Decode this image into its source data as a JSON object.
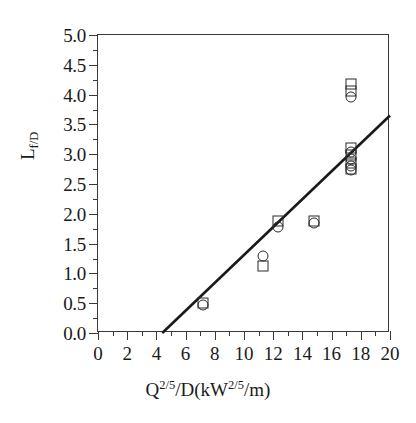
{
  "chart_data": {
    "type": "scatter",
    "title": "",
    "xlabel": "Q2/5/D(kW2/5/m)",
    "ylabel": "Lf/D",
    "xlabel_parts": {
      "base1": "Q",
      "sup1": "2/5",
      "mid": "/D(kW",
      "sup2": "2/5",
      "tail": "/m)"
    },
    "ylabel_parts": {
      "base": "L",
      "sub": "f/D"
    },
    "xlim": [
      0,
      20
    ],
    "ylim": [
      0,
      5.0
    ],
    "x_major_ticks": [
      0,
      2,
      4,
      6,
      8,
      10,
      12,
      14,
      16,
      18,
      20
    ],
    "x_minor_ticks": [
      1,
      3,
      5,
      7,
      9,
      11,
      13,
      15,
      17,
      19
    ],
    "x_tick_labels": [
      "0",
      "2",
      "4",
      "6",
      "8",
      "10",
      "12",
      "14",
      "16",
      "18",
      "20"
    ],
    "y_major_ticks": [
      0.0,
      0.5,
      1.0,
      1.5,
      2.0,
      2.5,
      3.0,
      3.5,
      4.0,
      4.5,
      5.0
    ],
    "y_minor_ticks": [
      0.25,
      0.75,
      1.25,
      1.75,
      2.25,
      2.75,
      3.25,
      3.75,
      4.25,
      4.75
    ],
    "y_tick_labels": [
      "0.0",
      "0.5",
      "1.0",
      "1.5",
      "2.0",
      "2.5",
      "3.0",
      "3.5",
      "4.0",
      "4.5",
      "5.0"
    ],
    "grid": false,
    "legend": null,
    "marker_color": "#2b2b2b",
    "line_color": "#1a1a1a",
    "series": [
      {
        "name": "square",
        "marker": "open-square",
        "points": [
          {
            "x": 7.2,
            "y": 0.5
          },
          {
            "x": 11.3,
            "y": 1.13
          },
          {
            "x": 12.3,
            "y": 1.88
          },
          {
            "x": 14.8,
            "y": 1.88
          },
          {
            "x": 17.3,
            "y": 4.18
          },
          {
            "x": 17.3,
            "y": 4.06
          },
          {
            "x": 17.3,
            "y": 3.1
          },
          {
            "x": 17.3,
            "y": 2.98
          },
          {
            "x": 17.3,
            "y": 2.86
          },
          {
            "x": 17.3,
            "y": 2.76
          }
        ]
      },
      {
        "name": "circle",
        "marker": "open-circle",
        "points": [
          {
            "x": 7.2,
            "y": 0.47
          },
          {
            "x": 11.3,
            "y": 1.29
          },
          {
            "x": 12.3,
            "y": 1.78
          },
          {
            "x": 14.8,
            "y": 1.84
          },
          {
            "x": 17.3,
            "y": 3.96
          },
          {
            "x": 17.3,
            "y": 3.04
          },
          {
            "x": 17.3,
            "y": 2.92
          },
          {
            "x": 17.3,
            "y": 2.8
          },
          {
            "x": 17.3,
            "y": 2.74
          }
        ]
      }
    ],
    "trend_line": {
      "label": "",
      "x_start": 4.4,
      "y_start": 0.0,
      "x_end": 20.0,
      "y_end": 3.65,
      "slope": 0.234,
      "intercept": -1.03
    }
  }
}
